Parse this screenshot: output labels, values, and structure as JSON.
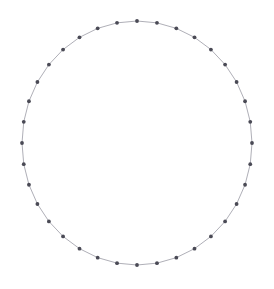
{
  "figure": {
    "title": "",
    "background_color": "#ffffff",
    "width": 274,
    "height": 289
  },
  "chart_data": {
    "type": "scatter",
    "title": "",
    "subtitle": "",
    "xlabel": "",
    "ylabel": "",
    "grid": false,
    "legend": null,
    "axes_visible": false,
    "tick_labels": [],
    "node_count": 36,
    "layout": "circular",
    "center_x": 137,
    "center_y": 143,
    "radius_x": 115,
    "radius_y": 122,
    "start_angle_deg": -90,
    "node_marker": {
      "shape": "circle",
      "radius_px": 1.9,
      "color": "#4a4a55"
    },
    "edge_style": {
      "color": "#9a9aa5",
      "width_px": 0.8,
      "closed": true
    },
    "xlim": [
      22,
      252
    ],
    "ylim": [
      21,
      265
    ],
    "series": [
      {
        "name": "ring-nodes",
        "values": [
          0,
          1,
          2,
          3,
          4,
          5,
          6,
          7,
          8,
          9,
          10,
          11,
          12,
          13,
          14,
          15,
          16,
          17,
          18,
          19,
          20,
          21,
          22,
          23,
          24,
          25,
          26,
          27,
          28,
          29,
          30,
          31,
          32,
          33,
          34,
          35
        ]
      }
    ]
  }
}
